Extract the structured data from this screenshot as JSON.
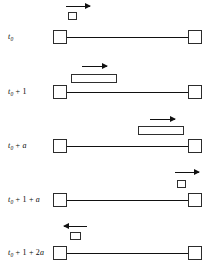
{
  "figure": {
    "type": "schematic-timeline-diagram",
    "canvas": {
      "width": 215,
      "height": 273,
      "background": "#ffffff"
    },
    "ink_color": "#111111",
    "rail": {
      "x_start": 54,
      "x_end": 201,
      "thickness": 1.6
    },
    "end_box": {
      "size": 14,
      "border": 1.1
    },
    "rows": [
      {
        "id": "row-1",
        "label": {
          "base": "t",
          "sub": "0",
          "op": "",
          "term": ""
        },
        "label_text": "t0",
        "label_x": 8,
        "rail_y": 37,
        "block": {
          "x": 68,
          "y": 12,
          "width": 9,
          "height": 8
        },
        "arrow": {
          "direction": "right",
          "x": 66,
          "y": 6,
          "length": 24
        }
      },
      {
        "id": "row-2",
        "label": {
          "base": "t",
          "sub": "0",
          "op": "+",
          "term": "1"
        },
        "label_text": "t0 + 1",
        "label_x": 8,
        "rail_y": 92,
        "block": {
          "x": 71,
          "y": 74,
          "width": 46,
          "height": 9
        },
        "arrow": {
          "direction": "right",
          "x": 82,
          "y": 66,
          "length": 25
        }
      },
      {
        "id": "row-3",
        "label": {
          "base": "t",
          "sub": "0",
          "op": "+",
          "term": "a"
        },
        "label_text": "t0 + a",
        "label_x": 8,
        "rail_y": 146,
        "block": {
          "x": 138,
          "y": 126,
          "width": 46,
          "height": 9
        },
        "arrow": {
          "direction": "right",
          "x": 150,
          "y": 119,
          "length": 25
        }
      },
      {
        "id": "row-4",
        "label": {
          "base": "t",
          "sub": "0",
          "op": "+",
          "term": "1 + a"
        },
        "label_text": "t0 + 1 + a",
        "label_x": 8,
        "rail_y": 200,
        "block": {
          "x": 177,
          "y": 180,
          "width": 9,
          "height": 8
        },
        "arrow": {
          "direction": "right",
          "x": 175,
          "y": 172,
          "length": 24
        }
      },
      {
        "id": "row-5",
        "label": {
          "base": "t",
          "sub": "0",
          "op": "+",
          "term": "1 + 2a"
        },
        "label_text": "t0 + 1 + 2a",
        "label_x": 8,
        "rail_y": 253,
        "block": {
          "x": 70,
          "y": 232,
          "width": 11,
          "height": 8
        },
        "arrow": {
          "direction": "left",
          "x": 64,
          "y": 226,
          "length": 23
        }
      }
    ]
  }
}
